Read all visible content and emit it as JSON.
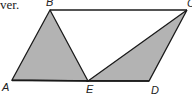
{
  "caption_fragment": "ver.",
  "figure": {
    "type": "parallelogram",
    "points": {
      "A": {
        "label": "A",
        "x": 12,
        "y": 80
      },
      "B": {
        "label": "B",
        "x": 50,
        "y": 10
      },
      "C": {
        "label": "C",
        "x": 187,
        "y": 10
      },
      "D": {
        "label": "D",
        "x": 149,
        "y": 81
      },
      "E": {
        "label": "E",
        "x": 88,
        "y": 81
      }
    },
    "shaded_regions": [
      "triangle ABE",
      "triangle ECD"
    ],
    "colors": {
      "shade": "#b3b3b3",
      "stroke": "#1a1a1a"
    }
  }
}
